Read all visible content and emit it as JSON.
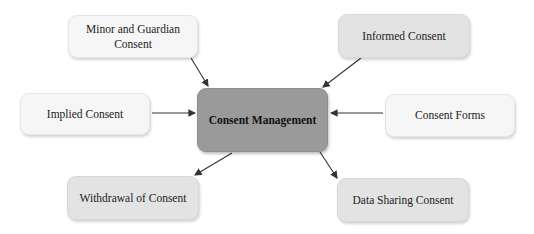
{
  "diagram": {
    "type": "hub-and-spoke concept map",
    "center": {
      "label": "Consent Management"
    },
    "nodes": [
      {
        "id": "minor",
        "label": "Minor and Guardian Consent"
      },
      {
        "id": "informed",
        "label": "Informed Consent"
      },
      {
        "id": "implied",
        "label": "Implied Consent"
      },
      {
        "id": "forms",
        "label": "Consent Forms"
      },
      {
        "id": "withdrawal",
        "label": "Withdrawal of Consent"
      },
      {
        "id": "sharing",
        "label": "Data Sharing Consent"
      }
    ],
    "edges": [
      {
        "from": "Minor and Guardian Consent",
        "to": "Consent Management"
      },
      {
        "from": "Informed Consent",
        "to": "Consent Management"
      },
      {
        "from": "Implied Consent",
        "to": "Consent Management"
      },
      {
        "from": "Consent Forms",
        "to": "Consent Management"
      },
      {
        "from": "Consent Management",
        "to": "Withdrawal of Consent"
      },
      {
        "from": "Consent Management",
        "to": "Data Sharing Consent"
      }
    ],
    "colors": {
      "center": "#9a9a9a",
      "node_light": "#f6f6f6",
      "node_mid": "#e3e3e3",
      "arrow": "#333333"
    }
  }
}
